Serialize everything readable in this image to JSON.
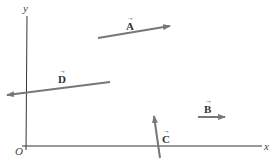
{
  "diagram": {
    "axes": {
      "x_label": "x",
      "y_label": "y",
      "origin_label": "O"
    },
    "vectors": [
      {
        "name": "A",
        "label": "A",
        "tail": [
          98,
          37
        ],
        "head": [
          170,
          26
        ]
      },
      {
        "name": "B",
        "label": "B",
        "tail": [
          198,
          117
        ],
        "head": [
          225,
          117
        ]
      },
      {
        "name": "C",
        "label": "C",
        "tail": [
          160,
          156
        ],
        "head": [
          154,
          114
        ]
      },
      {
        "name": "D",
        "label": "D",
        "tail": [
          110,
          82
        ],
        "head": [
          5,
          95
        ]
      }
    ],
    "colors": {
      "axis": "#333333",
      "vector": "#777777",
      "text": "#333333"
    },
    "arrow_symbol": "→"
  }
}
